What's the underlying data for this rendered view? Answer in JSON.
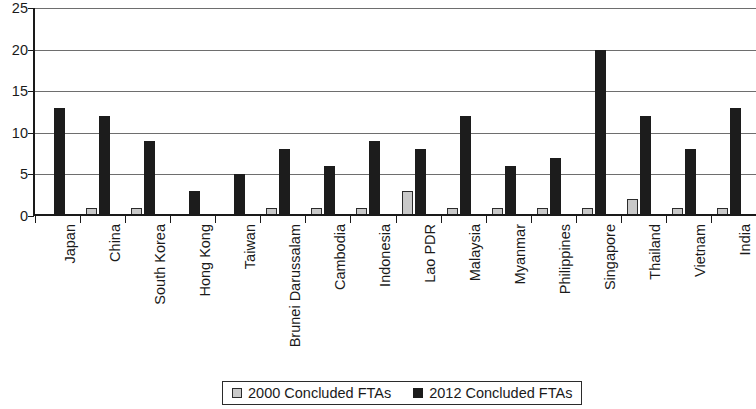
{
  "chart_data": {
    "type": "bar",
    "title": "",
    "subtitle": "",
    "xlabel": "",
    "ylabel": "",
    "ylim": [
      0,
      25
    ],
    "ytick_step": 5,
    "yticks": [
      0,
      5,
      10,
      15,
      20,
      25
    ],
    "grid": true,
    "grid_axis": "y",
    "legend_position": "bottom-center",
    "categories": [
      "Japan",
      "China",
      "South Korea",
      "Hong Kong",
      "Taiwan",
      "Brunei Darussalam",
      "Cambodia",
      "Indonesia",
      "Lao PDR",
      "Malaysia",
      "Myanmar",
      "Philippines",
      "Singapore",
      "Thailand",
      "Vietnam",
      "India"
    ],
    "series": [
      {
        "name": "2000 Concluded FTAs",
        "color": "#c9c9c9",
        "values": [
          0,
          1,
          1,
          0,
          0,
          1,
          1,
          1,
          3,
          1,
          1,
          1,
          1,
          2,
          1,
          1
        ]
      },
      {
        "name": "2012 Concluded FTAs",
        "color": "#1c1c1c",
        "values": [
          13,
          12,
          9,
          3,
          5,
          8,
          6,
          9,
          8,
          12,
          6,
          7,
          20,
          12,
          8,
          13
        ]
      }
    ]
  },
  "legend": {
    "items": [
      {
        "label": "2000 Concluded FTAs",
        "swatch": "grey-square-swatch"
      },
      {
        "label": "2012 Concluded FTAs",
        "swatch": "black-square-swatch"
      }
    ]
  }
}
